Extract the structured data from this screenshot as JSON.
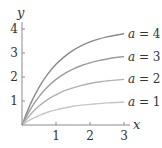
{
  "chart_data": {
    "type": "line",
    "title": "",
    "xlabel": "x",
    "ylabel": "y",
    "xlim": [
      0,
      3
    ],
    "ylim": [
      0,
      4.2
    ],
    "xticks": [
      1,
      2,
      3
    ],
    "yticks": [
      1,
      2,
      3,
      4
    ],
    "grid": false,
    "legend_position": "inline-right",
    "function": "y = a(1 - e^{-x})",
    "x": [
      0,
      0.25,
      0.5,
      0.75,
      1.0,
      1.25,
      1.5,
      1.75,
      2.0,
      2.25,
      2.5,
      2.75,
      3.0
    ],
    "series": [
      {
        "name": "a = 4",
        "label": "a = 4",
        "color": "#8a8a8a",
        "values": [
          0,
          0.88,
          1.57,
          2.11,
          2.53,
          2.85,
          3.11,
          3.31,
          3.46,
          3.58,
          3.67,
          3.74,
          3.8
        ]
      },
      {
        "name": "a = 3",
        "label": "a = 3",
        "color": "#9c9c9c",
        "values": [
          0,
          0.66,
          1.18,
          1.58,
          1.9,
          2.14,
          2.33,
          2.48,
          2.59,
          2.68,
          2.75,
          2.81,
          2.85
        ]
      },
      {
        "name": "a = 2",
        "label": "a = 2",
        "color": "#b0b0b0",
        "values": [
          0,
          0.44,
          0.79,
          1.06,
          1.26,
          1.43,
          1.55,
          1.65,
          1.73,
          1.79,
          1.84,
          1.87,
          1.9
        ]
      },
      {
        "name": "a = 1",
        "label": "a = 1",
        "color": "#c6c6c6",
        "values": [
          0,
          0.22,
          0.39,
          0.53,
          0.63,
          0.71,
          0.78,
          0.83,
          0.86,
          0.89,
          0.92,
          0.94,
          0.95
        ]
      }
    ],
    "axis_color": "#8a8a8a"
  }
}
